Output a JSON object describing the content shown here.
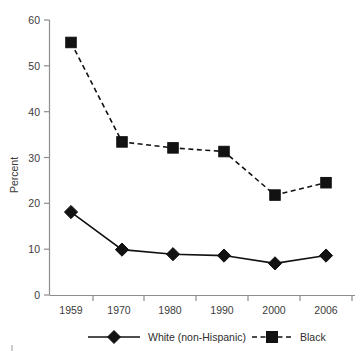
{
  "chart_data": {
    "type": "line",
    "title": "",
    "xlabel": "",
    "ylabel": "Percent",
    "categories": [
      "1959",
      "1970",
      "1980",
      "1990",
      "2000",
      "2006"
    ],
    "ylim": [
      0,
      60
    ],
    "yticks": [
      0,
      10,
      20,
      30,
      40,
      50,
      60
    ],
    "ytick_labels": [
      "0",
      "10",
      "20",
      "30",
      "40",
      "50",
      "60"
    ],
    "grid": false,
    "legend_position": "bottom",
    "series": [
      {
        "name": "White (non-Hispanic)",
        "marker": "diamond",
        "linestyle": "solid",
        "color": "#121212",
        "values": [
          18.1,
          9.9,
          8.9,
          8.6,
          6.9,
          8.6
        ]
      },
      {
        "name": "Black",
        "marker": "square",
        "linestyle": "dashed",
        "color": "#121212",
        "values": [
          55.1,
          33.4,
          32.1,
          31.3,
          21.8,
          24.5
        ]
      }
    ]
  },
  "axis": {
    "y_title": "Percent"
  },
  "legend": {
    "items": [
      {
        "label": "White (non-Hispanic)"
      },
      {
        "label": "Black"
      }
    ]
  }
}
